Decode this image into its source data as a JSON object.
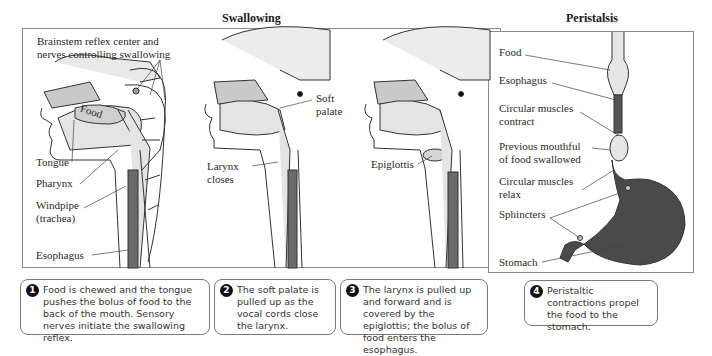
{
  "figure": {
    "swallowing_title": "Swallowing",
    "peristalsis_title": "Peristalsis",
    "colors": {
      "bone": "#c9c9c9",
      "tissue": "#e4e4e4",
      "esophagus_dark": "#555555",
      "stomach_fill": "#4a4a4a",
      "outline": "#333333"
    }
  },
  "panel1": {
    "labels": {
      "brainstem": "Brainstem reflex center and\nnerves controlling swallowing",
      "food": "Food",
      "tongue": "Tongue",
      "pharynx": "Pharynx",
      "windpipe": "Windpipe\n(trachea)",
      "esophagus": "Esophagus"
    }
  },
  "panel2": {
    "labels": {
      "soft_palate": "Soft\npalate",
      "larynx": "Larynx\ncloses"
    }
  },
  "panel3": {
    "labels": {
      "epiglottis": "Epiglottis"
    }
  },
  "panel4": {
    "labels": {
      "food": "Food",
      "esophagus": "Esophagus",
      "contract": "Circular muscles\ncontract",
      "previous": "Previous mouthful\nof food swallowed",
      "relax": "Circular muscles\nrelax",
      "sphincters": "Sphincters",
      "stomach": "Stomach"
    }
  },
  "captions": [
    {
      "num": "1",
      "text": "Food is chewed and the tongue pushes the bolus of food to the back of the mouth. Sensory nerves initiate the swallowing reflex."
    },
    {
      "num": "2",
      "text": "The soft palate is pulled up as the vocal cords close the larynx."
    },
    {
      "num": "3",
      "text": "The larynx is pulled up and forward and is covered by the epiglottis; the bolus of food enters the esophagus."
    },
    {
      "num": "4",
      "text": "Peristaltic contractions propel the food to the stomach."
    }
  ]
}
